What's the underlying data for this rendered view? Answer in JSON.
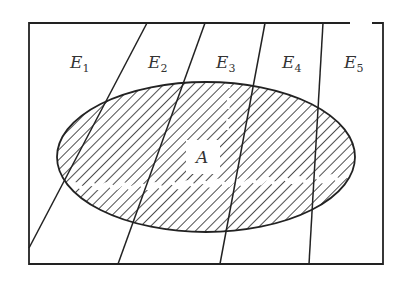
{
  "diagram": {
    "type": "partition-venn",
    "colors": {
      "stroke": "#222222",
      "background": "#ffffff",
      "hatch": "#222222"
    },
    "regions": [
      {
        "id": "E1",
        "base": "E",
        "sub": "1"
      },
      {
        "id": "E2",
        "base": "E",
        "sub": "2"
      },
      {
        "id": "E3",
        "base": "E",
        "sub": "3"
      },
      {
        "id": "E4",
        "base": "E",
        "sub": "4"
      },
      {
        "id": "E5",
        "base": "E",
        "sub": "5"
      }
    ],
    "event": {
      "label": "A"
    }
  }
}
